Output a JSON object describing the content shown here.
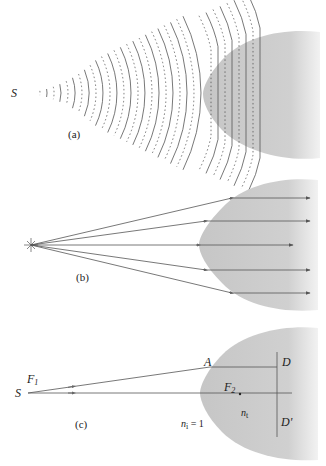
{
  "figure": {
    "panels": [
      {
        "id": "a",
        "caption": "(a)",
        "source_label": "S",
        "description": "Spherical wavefronts from point source S enter a hyperbolic lens and become plane waves"
      },
      {
        "id": "b",
        "caption": "(b)",
        "description": "Diverging rays from a point source are refracted parallel by the hyperbolic lens",
        "ray_count": 5
      },
      {
        "id": "c",
        "caption": "(c)",
        "source_label": "S",
        "focus1_label": "F",
        "focus1_sub": "1",
        "focus2_label": "F",
        "focus2_sub": "2",
        "point_a_label": "A",
        "point_d_label": "D",
        "point_d_prime_label": "D'",
        "outside_index_label": "n",
        "outside_index_sub": "i",
        "outside_index_value": " = 1",
        "inside_index_label": "n",
        "inside_index_sub": "t"
      }
    ],
    "colors": {
      "lens_fill": "#c9c9c9",
      "line": "#555555",
      "text": "#222222"
    }
  }
}
